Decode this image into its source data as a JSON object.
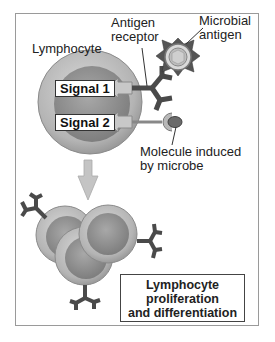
{
  "labels": {
    "lymphocyte": "Lymphocyte",
    "antigen_receptor_line1": "Antigen",
    "antigen_receptor_line2": "receptor",
    "microbial_antigen_line1": "Microbial",
    "microbial_antigen_line2": "antigen",
    "molecule_line1": "Molecule induced",
    "molecule_line2": "by microbe",
    "signal1": "Signal 1",
    "signal2": "Signal 2"
  },
  "outcome": {
    "line1": "Lymphocyte",
    "line2": "proliferation",
    "line3": "and differentiation"
  },
  "colors": {
    "cell_outer": "#b0b0b0",
    "cell_inner": "#8c8c8c",
    "receptor": "#4a4a4a",
    "arrow": "#bdbdbd"
  }
}
